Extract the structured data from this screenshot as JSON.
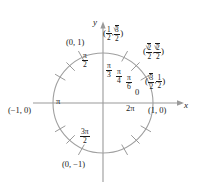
{
  "figure": {
    "type": "unit-circle-diagram",
    "background": "#ffffff",
    "axis_color": "#9a9a9a",
    "circle_color": "#a0a0a0",
    "text_color": "#1a1a1a",
    "center": {
      "x": 103,
      "y": 103
    },
    "radius": 50
  },
  "axes": {
    "x_label": "x",
    "y_label": "y"
  },
  "angles": [
    {
      "label_num": "π",
      "label_den": "6",
      "degrees": 30,
      "display": "π/6"
    },
    {
      "label_num": "π",
      "label_den": "4",
      "degrees": 45,
      "display": "π/4"
    },
    {
      "label_num": "π",
      "label_den": "3",
      "degrees": 60,
      "display": "π/3"
    },
    {
      "label_num": "π",
      "label_den": "2",
      "degrees": 90,
      "display": "π/2"
    },
    {
      "label_num": "3π",
      "label_den": "2",
      "degrees": 270,
      "display": "3π/2"
    }
  ],
  "axis_angles": {
    "zero": "0",
    "two_pi": "2π",
    "pi": "π"
  },
  "points": [
    {
      "name": "point-0-1",
      "text": "(0, 1)",
      "degrees": 90
    },
    {
      "name": "point-neg1-0",
      "text": "(−1, 0)",
      "degrees": 180
    },
    {
      "name": "point-0-neg1",
      "text": "(0, −1)",
      "degrees": 270
    },
    {
      "name": "point-1-0",
      "text": "(1, 0)",
      "degrees": 0
    }
  ],
  "coordinate_labels": [
    {
      "name": "coord-60deg",
      "degrees": 60,
      "x_num": "1",
      "x_den": "2",
      "y_radicand": "3",
      "y_den": "2"
    },
    {
      "name": "coord-45deg",
      "degrees": 45,
      "x_radicand": "2",
      "x_den": "2",
      "y_radicand": "2",
      "y_den": "2"
    },
    {
      "name": "coord-30deg",
      "degrees": 30,
      "x_radicand": "3",
      "x_den": "2",
      "y_num": "1",
      "y_den": "2"
    }
  ],
  "ticks": {
    "count": 20,
    "degrees": [
      30,
      45,
      60,
      120,
      135,
      150,
      210,
      225,
      240,
      300,
      315,
      330
    ]
  },
  "punctuation": {
    "open_paren": "(",
    "close_paren": ")",
    "comma": ",",
    "radical": "√"
  }
}
